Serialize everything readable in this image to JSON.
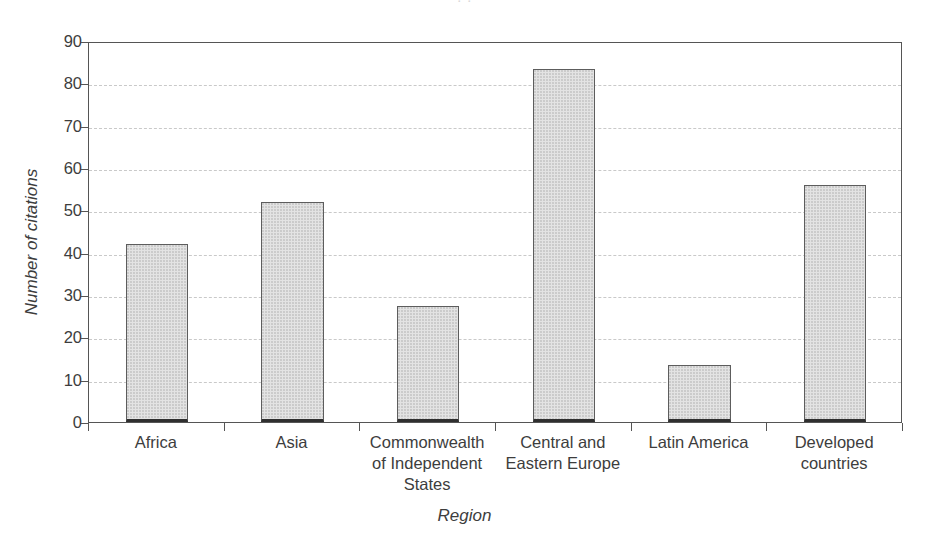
{
  "figure": {
    "top_fragment": "· ·"
  },
  "chart_data": {
    "type": "bar",
    "title": "",
    "xlabel": "Region",
    "ylabel": "Number of citations",
    "categories": [
      "Africa",
      "Asia",
      "Commonwealth\nof Independent\nStates",
      "Central and\nEastern Europe",
      "Latin America",
      "Developed\ncountries"
    ],
    "category_lines": [
      [
        "Africa"
      ],
      [
        "Asia"
      ],
      [
        "Commonwealth",
        "of Independent",
        "States"
      ],
      [
        "Central and",
        "Eastern Europe"
      ],
      [
        "Latin America"
      ],
      [
        "Developed",
        "countries"
      ]
    ],
    "values": [
      42,
      52,
      27.5,
      83.5,
      13.5,
      56
    ],
    "ylim": [
      0,
      90
    ],
    "yticks": [
      0,
      10,
      20,
      30,
      40,
      50,
      60,
      70,
      80,
      90
    ],
    "ytick_labels": [
      "0",
      "10",
      "20",
      "30",
      "40",
      "50",
      "60",
      "70",
      "80",
      "90"
    ],
    "grid": "horizontal-dashed",
    "legend": "none",
    "bar_fill": "#e3e3e3",
    "bar_edge": "#5d5d5d",
    "grid_color": "#c9c9c9",
    "axis_color": "#555555",
    "text_color": "#3d3d3d"
  }
}
